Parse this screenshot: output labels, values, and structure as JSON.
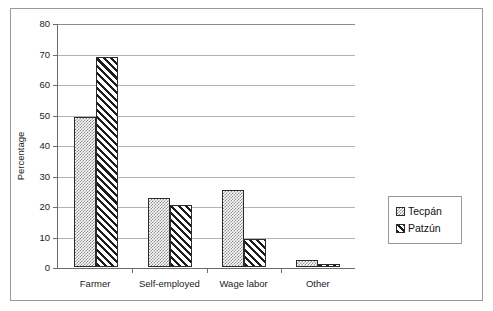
{
  "chart_data": {
    "type": "bar",
    "title": "",
    "subtitle": "",
    "xlabel": "",
    "ylabel": "Percentage",
    "ylim": [
      0,
      80
    ],
    "yticks": [
      0,
      10,
      20,
      30,
      40,
      50,
      60,
      70,
      80
    ],
    "ytick_labels": [
      "0",
      "10",
      "20",
      "30",
      "40",
      "50",
      "60",
      "70",
      "80"
    ],
    "grid": "horizontal",
    "legend_position": "right-outside",
    "categories": [
      "Farmer",
      "Self-employed",
      "Wage labor",
      "Other"
    ],
    "series": [
      {
        "name": "Tecpán",
        "pattern": "dotted-checker",
        "color": "#8f8f8f",
        "values": [
          49.5,
          22.7,
          25.3,
          2.3
        ]
      },
      {
        "name": "Patzún",
        "pattern": "diagonal-hatch",
        "color": "#1c1c1c",
        "values": [
          69.0,
          20.3,
          9.3,
          1.1
        ]
      }
    ]
  },
  "legend": {
    "entries": [
      {
        "label": "Tecpán"
      },
      {
        "label": "Patzún"
      }
    ]
  }
}
